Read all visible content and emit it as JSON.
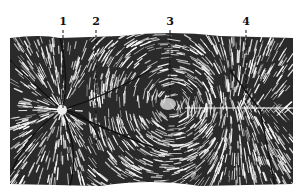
{
  "figure": {
    "labels": [
      {
        "text": "1",
        "x": 63,
        "y": 16
      },
      {
        "text": "2",
        "x": 96,
        "y": 16
      },
      {
        "text": "3",
        "x": 170,
        "y": 16
      },
      {
        "text": "4",
        "x": 246,
        "y": 16
      }
    ],
    "features": {
      "disc_center": [
        62,
        110
      ],
      "fovea_center": [
        168,
        104
      ],
      "raphe_y": 108
    },
    "colors": {
      "ink": "#111111",
      "paper": "#ffffff"
    }
  }
}
